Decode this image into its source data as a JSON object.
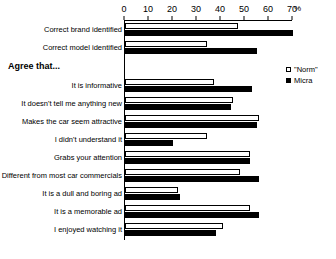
{
  "chart_data": {
    "type": "bar",
    "orientation": "horizontal",
    "title": "",
    "xlabel": "%",
    "ylabel": "",
    "xlim": [
      0,
      70
    ],
    "xticks": [
      0,
      10,
      20,
      30,
      40,
      50,
      60,
      70
    ],
    "grid": false,
    "legend_position": "right",
    "series": [
      {
        "name": "\"Norm\"",
        "color": "#ffffff",
        "values": [
          47,
          34,
          37,
          45,
          56,
          34,
          52,
          48,
          22,
          52,
          41
        ]
      },
      {
        "name": "Micra",
        "color": "#000000",
        "values": [
          70,
          55,
          53,
          44,
          55,
          20,
          52,
          56,
          23,
          56,
          38
        ]
      }
    ],
    "categories": [
      "Correct brand identified",
      "Correct model identified",
      "It is informative",
      "It doesn't tell me anything new",
      "Makes the car seem attractive",
      "I didn't understand it",
      "Grabs your attention",
      "Different from most car commercials",
      "It is a dull and boring ad",
      "It is a memorable ad",
      "I enjoyed watching it"
    ],
    "section_header": "Agree that...",
    "section_header_before_index": 2
  },
  "axis": {
    "unit_label": "%",
    "ticks": [
      {
        "value": 0,
        "label": "0"
      },
      {
        "value": 10,
        "label": "10"
      },
      {
        "value": 20,
        "label": "20"
      },
      {
        "value": 30,
        "label": "30"
      },
      {
        "value": 40,
        "label": "40"
      },
      {
        "value": 50,
        "label": "50"
      },
      {
        "value": 60,
        "label": "60"
      },
      {
        "value": 70,
        "label": "70"
      }
    ]
  },
  "legend": {
    "items": [
      {
        "label": "\"Norm\"",
        "swatch": "hollow-square-icon"
      },
      {
        "label": "Micra",
        "swatch": "filled-square-icon"
      }
    ]
  }
}
